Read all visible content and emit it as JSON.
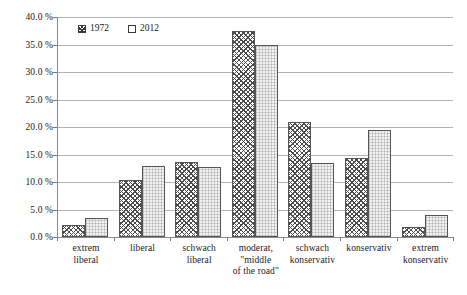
{
  "chart_data": {
    "type": "bar",
    "title": "",
    "subtitle": "",
    "xlabel": "",
    "ylabel": "",
    "ylim": [
      0,
      40
    ],
    "ytick_values": [
      40.0,
      35.0,
      30.0,
      25.0,
      20.0,
      15.0,
      10.0,
      5.0,
      0.0
    ],
    "ytick_labels": [
      "40.0 %",
      "35.0 %",
      "30.0 %",
      "25.0 %",
      "20.0 %",
      "15.0 %",
      "10.0 %",
      "5.0 %",
      "0.0 %"
    ],
    "grid": true,
    "legend_position": "top-left-inside",
    "value_unit": "%",
    "categories": [
      "extrem liberal",
      "liberal",
      "schwach liberal",
      "moderat, \"middle of the road\"",
      "schwach konservativ",
      "konservativ",
      "extrem konservativ"
    ],
    "category_label_lines": [
      [
        "extrem",
        "liberal"
      ],
      [
        "liberal"
      ],
      [
        "schwach",
        "liberal"
      ],
      [
        "moderat,",
        "\"middle",
        "of the road\""
      ],
      [
        "schwach",
        "konservativ"
      ],
      [
        "konservativ"
      ],
      [
        "extrem",
        "konservativ"
      ]
    ],
    "series": [
      {
        "name": "1972",
        "fill": "cross-hatch",
        "color": "#ffffff",
        "edge_color": "#555555",
        "values": [
          2.2,
          10.3,
          13.7,
          37.5,
          21.0,
          14.3,
          1.8
        ]
      },
      {
        "name": "2012",
        "fill": "light-dotted",
        "color": "#f2f2f2",
        "edge_color": "#555555",
        "values": [
          3.4,
          13.0,
          12.7,
          35.0,
          13.4,
          19.5,
          4.0
        ]
      }
    ]
  },
  "legend": {
    "entries": [
      {
        "label": "1972"
      },
      {
        "label": "2012"
      }
    ]
  }
}
